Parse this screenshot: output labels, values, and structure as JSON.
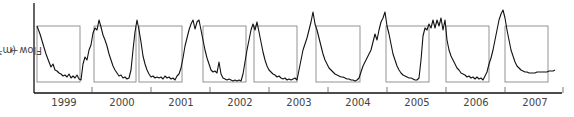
{
  "chart_data": {
    "type": "line",
    "title": "",
    "xlabel": "",
    "ylabel": "Flow (m³/s)",
    "ylabel_arrow": "→",
    "grid": false,
    "legend": null,
    "x_tick_labels": [
      "1999",
      "2000",
      "2001",
      "2002",
      "2003",
      "2004",
      "2005",
      "2006",
      "2007"
    ],
    "annotations": "Rectangular boxes mark the recession period of each year's hydrograph",
    "colors": {
      "line": "#111111",
      "box": "#888888",
      "axis": "#111111",
      "text": "#444444"
    },
    "series": [
      {
        "name": "Flow",
        "points": [
          [
            37,
            26
          ],
          [
            40,
            34
          ],
          [
            43,
            44
          ],
          [
            46,
            54
          ],
          [
            49,
            62
          ],
          [
            51,
            67
          ],
          [
            53,
            64
          ],
          [
            55,
            70
          ],
          [
            57,
            71
          ],
          [
            59,
            73
          ],
          [
            61,
            74
          ],
          [
            63,
            76
          ],
          [
            65,
            75
          ],
          [
            67,
            77
          ],
          [
            69,
            74
          ],
          [
            71,
            78
          ],
          [
            73,
            76
          ],
          [
            75,
            78
          ],
          [
            77,
            75
          ],
          [
            79,
            79
          ],
          [
            81,
            80
          ],
          [
            83,
            64
          ],
          [
            85,
            57
          ],
          [
            87,
            60
          ],
          [
            89,
            50
          ],
          [
            91,
            45
          ],
          [
            93,
            33
          ],
          [
            95,
            28
          ],
          [
            97,
            30
          ],
          [
            99,
            20
          ],
          [
            101,
            27
          ],
          [
            103,
            35
          ],
          [
            105,
            40
          ],
          [
            107,
            46
          ],
          [
            109,
            54
          ],
          [
            111,
            60
          ],
          [
            113,
            66
          ],
          [
            115,
            70
          ],
          [
            117,
            73
          ],
          [
            119,
            76
          ],
          [
            121,
            75
          ],
          [
            123,
            78
          ],
          [
            125,
            77
          ],
          [
            127,
            79
          ],
          [
            129,
            78
          ],
          [
            131,
            70
          ],
          [
            133,
            50
          ],
          [
            135,
            32
          ],
          [
            137,
            20
          ],
          [
            139,
            30
          ],
          [
            141,
            42
          ],
          [
            143,
            56
          ],
          [
            145,
            64
          ],
          [
            147,
            70
          ],
          [
            149,
            74
          ],
          [
            151,
            77
          ],
          [
            153,
            76
          ],
          [
            155,
            78
          ],
          [
            157,
            77
          ],
          [
            159,
            78
          ],
          [
            161,
            77
          ],
          [
            163,
            79
          ],
          [
            165,
            76
          ],
          [
            167,
            78
          ],
          [
            169,
            77
          ],
          [
            171,
            79
          ],
          [
            173,
            78
          ],
          [
            175,
            80
          ],
          [
            177,
            76
          ],
          [
            179,
            74
          ],
          [
            181,
            68
          ],
          [
            183,
            58
          ],
          [
            185,
            46
          ],
          [
            187,
            38
          ],
          [
            189,
            30
          ],
          [
            191,
            24
          ],
          [
            193,
            20
          ],
          [
            195,
            29
          ],
          [
            197,
            22
          ],
          [
            199,
            20
          ],
          [
            201,
            30
          ],
          [
            203,
            40
          ],
          [
            205,
            50
          ],
          [
            207,
            58
          ],
          [
            209,
            64
          ],
          [
            211,
            70
          ],
          [
            213,
            72
          ],
          [
            215,
            71
          ],
          [
            217,
            73
          ],
          [
            219,
            62
          ],
          [
            221,
            74
          ],
          [
            223,
            78
          ],
          [
            225,
            79
          ],
          [
            227,
            80
          ],
          [
            229,
            79
          ],
          [
            231,
            80
          ],
          [
            233,
            81
          ],
          [
            235,
            80
          ],
          [
            237,
            81
          ],
          [
            239,
            80
          ],
          [
            241,
            81
          ],
          [
            243,
            74
          ],
          [
            245,
            62
          ],
          [
            247,
            50
          ],
          [
            249,
            40
          ],
          [
            251,
            30
          ],
          [
            253,
            24
          ],
          [
            255,
            30
          ],
          [
            257,
            22
          ],
          [
            259,
            32
          ],
          [
            261,
            42
          ],
          [
            263,
            52
          ],
          [
            265,
            60
          ],
          [
            267,
            66
          ],
          [
            269,
            70
          ],
          [
            271,
            72
          ],
          [
            273,
            74
          ],
          [
            275,
            75
          ],
          [
            277,
            77
          ],
          [
            279,
            76
          ],
          [
            281,
            78
          ],
          [
            283,
            79
          ],
          [
            285,
            78
          ],
          [
            287,
            80
          ],
          [
            289,
            79
          ],
          [
            291,
            80
          ],
          [
            293,
            79
          ],
          [
            295,
            78
          ],
          [
            297,
            80
          ],
          [
            299,
            70
          ],
          [
            301,
            60
          ],
          [
            303,
            50
          ],
          [
            305,
            44
          ],
          [
            307,
            38
          ],
          [
            309,
            30
          ],
          [
            311,
            22
          ],
          [
            313,
            12
          ],
          [
            315,
            24
          ],
          [
            317,
            30
          ],
          [
            319,
            38
          ],
          [
            321,
            46
          ],
          [
            323,
            54
          ],
          [
            325,
            60
          ],
          [
            327,
            64
          ],
          [
            329,
            68
          ],
          [
            331,
            70
          ],
          [
            333,
            72
          ],
          [
            335,
            74
          ],
          [
            337,
            75
          ],
          [
            339,
            76
          ],
          [
            341,
            77
          ],
          [
            343,
            77
          ],
          [
            345,
            78
          ],
          [
            347,
            79
          ],
          [
            349,
            79
          ],
          [
            351,
            80
          ],
          [
            353,
            80
          ],
          [
            355,
            81
          ],
          [
            357,
            80
          ],
          [
            359,
            78
          ],
          [
            361,
            72
          ],
          [
            363,
            66
          ],
          [
            365,
            62
          ],
          [
            367,
            58
          ],
          [
            369,
            54
          ],
          [
            371,
            50
          ],
          [
            373,
            42
          ],
          [
            375,
            34
          ],
          [
            377,
            40
          ],
          [
            379,
            30
          ],
          [
            381,
            22
          ],
          [
            383,
            18
          ],
          [
            385,
            12
          ],
          [
            387,
            26
          ],
          [
            389,
            34
          ],
          [
            391,
            44
          ],
          [
            393,
            54
          ],
          [
            395,
            60
          ],
          [
            397,
            66
          ],
          [
            399,
            70
          ],
          [
            401,
            73
          ],
          [
            403,
            75
          ],
          [
            405,
            76
          ],
          [
            407,
            77
          ],
          [
            409,
            78
          ],
          [
            411,
            78
          ],
          [
            413,
            79
          ],
          [
            415,
            80
          ],
          [
            417,
            80
          ],
          [
            419,
            78
          ],
          [
            421,
            60
          ],
          [
            423,
            36
          ],
          [
            425,
            28
          ],
          [
            427,
            30
          ],
          [
            429,
            24
          ],
          [
            431,
            28
          ],
          [
            433,
            20
          ],
          [
            435,
            28
          ],
          [
            437,
            20
          ],
          [
            439,
            26
          ],
          [
            441,
            18
          ],
          [
            443,
            30
          ],
          [
            445,
            20
          ],
          [
            447,
            40
          ],
          [
            449,
            50
          ],
          [
            451,
            56
          ],
          [
            453,
            60
          ],
          [
            455,
            64
          ],
          [
            457,
            68
          ],
          [
            459,
            70
          ],
          [
            461,
            73
          ],
          [
            463,
            74
          ],
          [
            465,
            75
          ],
          [
            467,
            77
          ],
          [
            469,
            76
          ],
          [
            471,
            78
          ],
          [
            473,
            77
          ],
          [
            475,
            79
          ],
          [
            477,
            77
          ],
          [
            479,
            79
          ],
          [
            481,
            78
          ],
          [
            483,
            80
          ],
          [
            485,
            76
          ],
          [
            487,
            72
          ],
          [
            489,
            64
          ],
          [
            491,
            58
          ],
          [
            493,
            50
          ],
          [
            495,
            40
          ],
          [
            497,
            30
          ],
          [
            499,
            20
          ],
          [
            501,
            14
          ],
          [
            503,
            10
          ],
          [
            505,
            18
          ],
          [
            507,
            30
          ],
          [
            509,
            40
          ],
          [
            511,
            50
          ],
          [
            513,
            56
          ],
          [
            515,
            62
          ],
          [
            517,
            66
          ],
          [
            519,
            68
          ],
          [
            521,
            70
          ],
          [
            523,
            71
          ],
          [
            525,
            72
          ],
          [
            527,
            72
          ],
          [
            529,
            73
          ],
          [
            531,
            73
          ],
          [
            533,
            73
          ],
          [
            535,
            73
          ],
          [
            537,
            72
          ],
          [
            539,
            72
          ],
          [
            541,
            72
          ],
          [
            543,
            72
          ],
          [
            545,
            72
          ],
          [
            547,
            72
          ],
          [
            549,
            71
          ],
          [
            551,
            71
          ],
          [
            553,
            71
          ],
          [
            555,
            70
          ]
        ]
      }
    ],
    "boxes": [
      {
        "year": "1999",
        "x0": 37,
        "x1": 80
      },
      {
        "year": "2000",
        "x0": 94,
        "x1": 136
      },
      {
        "year": "2001",
        "x0": 139,
        "x1": 182
      },
      {
        "year": "2002",
        "x0": 203,
        "x1": 246
      },
      {
        "year": "2003",
        "x0": 254,
        "x1": 297
      },
      {
        "year": "2004",
        "x0": 316,
        "x1": 360
      },
      {
        "year": "2005",
        "x0": 386,
        "x1": 429
      },
      {
        "year": "2006",
        "x0": 446,
        "x1": 489
      },
      {
        "year": "2007",
        "x0": 505,
        "x1": 548
      }
    ],
    "box_y": [
      26,
      82
    ],
    "ticks_x": [
      92,
      151,
      210,
      269,
      328,
      387,
      446,
      505,
      563
    ],
    "label_x": [
      64,
      122,
      181,
      240,
      299,
      358,
      417,
      476,
      535
    ],
    "axis": {
      "x0": 34,
      "x1": 562,
      "y0": 3,
      "y1": 93
    }
  }
}
